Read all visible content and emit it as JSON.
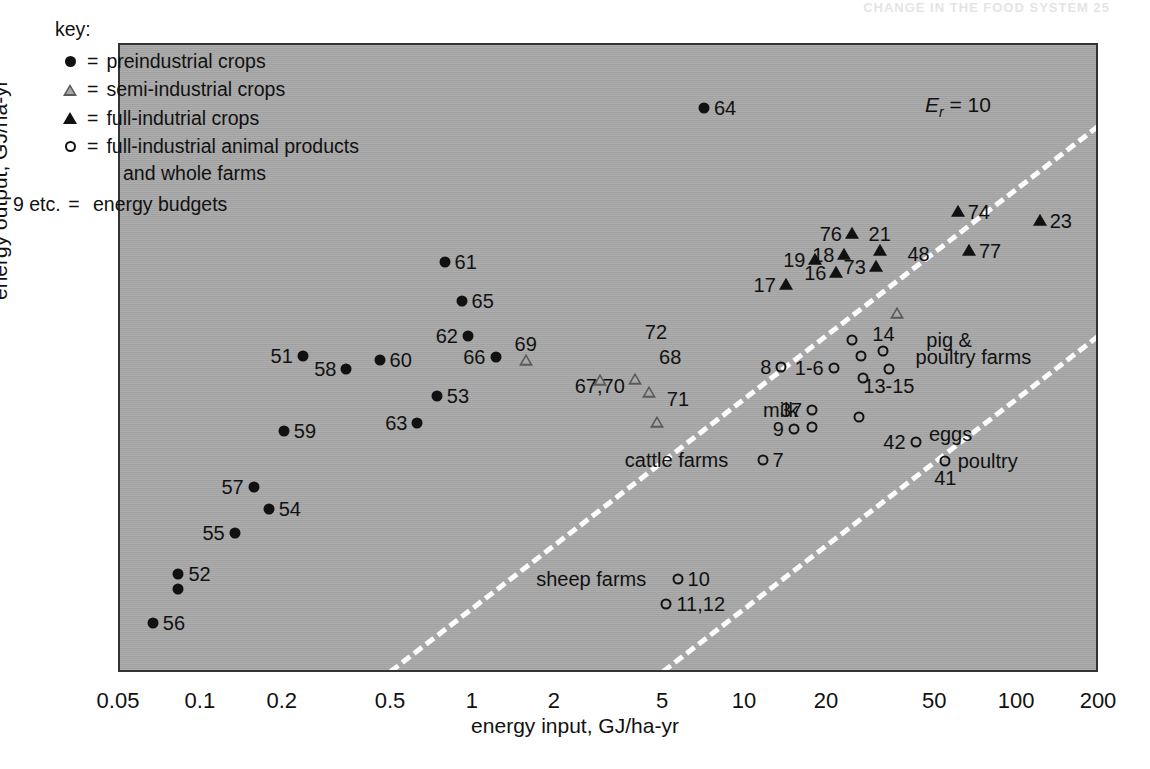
{
  "page_header": "CHANGE IN THE FOOD SYSTEM    25",
  "axes": {
    "x_label": "energy input, GJ/ha-yr",
    "y_label": "energy output, GJ/ha-yr",
    "x_ticks": [
      "0.05",
      "0.1",
      "0.2",
      "0.5",
      "1",
      "2",
      "5",
      "10",
      "20",
      "50",
      "100",
      "200"
    ],
    "y_ticks": [
      "0.5",
      "1",
      "2",
      "5",
      "10",
      "20",
      "50",
      "100",
      "200",
      "500"
    ]
  },
  "key": {
    "title": "key:",
    "equals": "=",
    "items": [
      {
        "symbol": "filled-circle",
        "label": "preindustrial crops"
      },
      {
        "symbol": "open-triangle",
        "label": "semi-industrial crops"
      },
      {
        "symbol": "filled-triangle",
        "label": "full-indutrial crops"
      },
      {
        "symbol": "open-circle",
        "label": "full-industrial animal products"
      }
    ],
    "continuation": "and whole farms",
    "budget_prefix": "9 etc.",
    "budget_label": "energy budgets"
  },
  "er_lines": [
    {
      "label_prefix": "E",
      "label_sub": "r",
      "label_value": "= 10",
      "ratio": 10
    },
    {
      "label_prefix": "E",
      "label_sub": "r",
      "label_value": "= 1",
      "ratio": 1
    },
    {
      "label_prefix": "E",
      "label_sub": "r",
      "label_value": "=0.1",
      "ratio": 0.1
    }
  ],
  "colors": {
    "plot_background": "#a9a9a9",
    "frame": "#333333",
    "marker": "#111111",
    "er_line": "#fdfdfd",
    "page_background": "#ffffff"
  },
  "chart_data": {
    "type": "scatter",
    "title": "",
    "xlabel": "energy input, GJ/ha-yr",
    "ylabel": "energy output, GJ/ha-yr",
    "xscale": "log",
    "yscale": "log",
    "xlim": [
      0.05,
      200
    ],
    "ylim": [
      0.5,
      500
    ],
    "grid": false,
    "legend_position": "top-left",
    "reference_lines": [
      {
        "name": "Er = 10",
        "type": "ratio",
        "value": 10
      },
      {
        "name": "Er = 1",
        "type": "ratio",
        "value": 1
      },
      {
        "name": "Er = 0.1",
        "type": "ratio",
        "value": 0.1
      }
    ],
    "series": [
      {
        "name": "preindustrial crops",
        "marker": "filled-circle",
        "points": [
          {
            "label": "56",
            "x": 0.066,
            "y": 0.88,
            "lp": "right"
          },
          {
            "label": "52",
            "x": 0.082,
            "y": 1.5,
            "lp": "right"
          },
          {
            "label": "",
            "x": 0.082,
            "y": 1.27,
            "lp": "none"
          },
          {
            "label": "55",
            "x": 0.132,
            "y": 2.35,
            "lp": "left"
          },
          {
            "label": "57",
            "x": 0.155,
            "y": 3.9,
            "lp": "left"
          },
          {
            "label": "54",
            "x": 0.176,
            "y": 3.05,
            "lp": "right"
          },
          {
            "label": "59",
            "x": 0.2,
            "y": 7.2,
            "lp": "right"
          },
          {
            "label": "51",
            "x": 0.235,
            "y": 16.5,
            "lp": "left"
          },
          {
            "label": "58",
            "x": 0.34,
            "y": 14.3,
            "lp": "left"
          },
          {
            "label": "60",
            "x": 0.45,
            "y": 15.8,
            "lp": "right"
          },
          {
            "label": "63",
            "x": 0.62,
            "y": 7.9,
            "lp": "left"
          },
          {
            "label": "53",
            "x": 0.73,
            "y": 10.6,
            "lp": "right"
          },
          {
            "label": "61",
            "x": 0.78,
            "y": 46.0,
            "lp": "right"
          },
          {
            "label": "65",
            "x": 0.9,
            "y": 30.0,
            "lp": "right"
          },
          {
            "label": "62",
            "x": 0.95,
            "y": 20.5,
            "lp": "left"
          },
          {
            "label": "66",
            "x": 1.2,
            "y": 16.2,
            "lp": "left"
          },
          {
            "label": "64",
            "x": 7.0,
            "y": 250.0,
            "lp": "right"
          }
        ]
      },
      {
        "name": "semi-industrial crops",
        "marker": "open-triangle",
        "points": [
          {
            "label": "69",
            "x": 1.55,
            "y": 15.6,
            "lp": "above"
          },
          {
            "label": "67,70",
            "x": 2.9,
            "y": 14.2,
            "lp": "below"
          },
          {
            "label": "71",
            "x": 4.7,
            "y": 10.2,
            "lp": "right"
          },
          {
            "label": "68",
            "x": 4.4,
            "y": 16.3,
            "lp": "right"
          },
          {
            "label": "72",
            "x": 3.9,
            "y": 21.5,
            "lp": "right"
          },
          {
            "label": "48",
            "x": 36.0,
            "y": 50.5,
            "lp": "right"
          }
        ]
      },
      {
        "name": "full-indutrial crops",
        "marker": "filled-triangle",
        "points": [
          {
            "label": "17",
            "x": 14.0,
            "y": 36.0,
            "lp": "left"
          },
          {
            "label": "19",
            "x": 18.0,
            "y": 47.0,
            "lp": "left"
          },
          {
            "label": "16",
            "x": 21.5,
            "y": 41.0,
            "lp": "left"
          },
          {
            "label": "18",
            "x": 23.0,
            "y": 50.0,
            "lp": "left"
          },
          {
            "label": "76",
            "x": 24.5,
            "y": 63.0,
            "lp": "left"
          },
          {
            "label": "73",
            "x": 30.0,
            "y": 43.5,
            "lp": "left"
          },
          {
            "label": "21",
            "x": 31.0,
            "y": 52.0,
            "lp": "above"
          },
          {
            "label": "74",
            "x": 60.0,
            "y": 80.0,
            "lp": "right"
          },
          {
            "label": "77",
            "x": 66.0,
            "y": 52.0,
            "lp": "right"
          },
          {
            "label": "23",
            "x": 120.0,
            "y": 72.0,
            "lp": "right"
          }
        ]
      },
      {
        "name": "full-industrial animal products and whole farms",
        "marker": "open-circle",
        "points": [
          {
            "label": "10",
            "x": 5.6,
            "y": 1.42,
            "lp": "right",
            "note": "sheep farms"
          },
          {
            "label": "11,12",
            "x": 5.1,
            "y": 1.08,
            "lp": "right"
          },
          {
            "label": "7",
            "x": 11.5,
            "y": 5.25,
            "lp": "right",
            "note": "cattle farms"
          },
          {
            "label": "8",
            "x": 13.5,
            "y": 14.5,
            "lp": "left"
          },
          {
            "label": "9",
            "x": 15.0,
            "y": 7.4,
            "lp": "left"
          },
          {
            "label": "37",
            "x": 17.5,
            "y": 9.1,
            "lp": "left",
            "note": "milk"
          },
          {
            "label": "",
            "x": 17.5,
            "y": 7.5,
            "lp": "none"
          },
          {
            "label": "1-6",
            "x": 21.0,
            "y": 14.4,
            "lp": "left"
          },
          {
            "label": "",
            "x": 24.5,
            "y": 19.5,
            "lp": "none"
          },
          {
            "label": "",
            "x": 26.5,
            "y": 16.4,
            "lp": "none"
          },
          {
            "label": "",
            "x": 27.0,
            "y": 12.9,
            "lp": "none"
          },
          {
            "label": "",
            "x": 26.0,
            "y": 8.4,
            "lp": "none"
          },
          {
            "label": "14",
            "x": 32.0,
            "y": 17.4,
            "lp": "above"
          },
          {
            "label": "13-15",
            "x": 33.5,
            "y": 14.3,
            "lp": "below"
          },
          {
            "label": "42",
            "x": 42.0,
            "y": 6.4,
            "lp": "left",
            "note": "eggs"
          },
          {
            "label": "41",
            "x": 54.0,
            "y": 5.2,
            "lp": "below",
            "note": "poultry"
          }
        ]
      }
    ],
    "annotations": [
      {
        "text": "sheep farms",
        "x": 4.3,
        "y": 1.42,
        "anchor": "right"
      },
      {
        "text": "cattle farms",
        "x": 8.6,
        "y": 5.25,
        "anchor": "right"
      },
      {
        "text": "milk",
        "x": 15.6,
        "y": 9.1,
        "anchor": "right"
      },
      {
        "text": "eggs",
        "x": 47.0,
        "y": 7.0,
        "anchor": "left"
      },
      {
        "text": "poultry",
        "x": 60.0,
        "y": 5.2,
        "anchor": "left"
      },
      {
        "text": "pig &",
        "x": 46.0,
        "y": 19.5,
        "anchor": "left"
      },
      {
        "text": "poultry farms",
        "x": 42.0,
        "y": 16.3,
        "anchor": "left"
      }
    ]
  }
}
